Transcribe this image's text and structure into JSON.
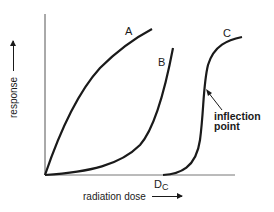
{
  "diagram": {
    "title": "",
    "x_axis_label": "radiation dose",
    "y_axis_label": "response",
    "curves": [
      {
        "name": "A",
        "shape": "concave-down, rises immediately from origin"
      },
      {
        "name": "B",
        "shape": "concave-up, slow start then steep rise"
      },
      {
        "name": "C",
        "shape": "sigmoid with threshold at Dc"
      }
    ],
    "annotations": {
      "inflection_line1": "inflection",
      "inflection_line2": "point",
      "threshold_main": "D",
      "threshold_sub": "C"
    },
    "labels": {
      "A": "A",
      "B": "B",
      "C": "C"
    },
    "colors": {
      "line": "#1a1a1a",
      "axis": "#555555",
      "background": "#ffffff"
    }
  }
}
